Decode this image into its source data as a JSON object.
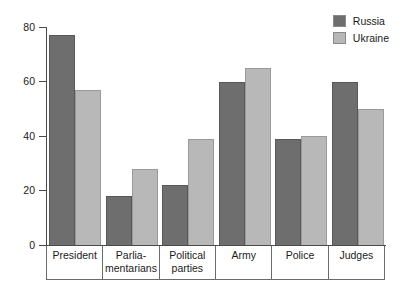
{
  "chart_data": {
    "type": "bar",
    "title": "",
    "subtitle": "",
    "xlabel": "",
    "ylabel": "",
    "ylim": [
      0,
      80
    ],
    "yticks": [
      0,
      20,
      40,
      60,
      80
    ],
    "grid": false,
    "legend_position": "top-right",
    "categories": [
      "President",
      "Parliamentarians",
      "Political parties",
      "Army",
      "Police",
      "Judges"
    ],
    "category_lines": [
      [
        "President"
      ],
      [
        "Parlia-",
        "mentarians"
      ],
      [
        "Political",
        "parties"
      ],
      [
        "Army"
      ],
      [
        "Police"
      ],
      [
        "Judges"
      ]
    ],
    "series": [
      {
        "name": "Russia",
        "color": "#6e6e6e",
        "values": [
          77,
          18,
          22,
          60,
          39,
          60
        ]
      },
      {
        "name": "Ukraine",
        "color": "#b8b8b8",
        "values": [
          57,
          28,
          39,
          65,
          40,
          50
        ]
      }
    ]
  },
  "legend": {
    "entries": [
      {
        "label": "Russia",
        "color": "#6e6e6e"
      },
      {
        "label": "Ukraine",
        "color": "#b8b8b8"
      }
    ]
  },
  "axis": {
    "y_tick_labels": [
      "80",
      "60",
      "40",
      "20",
      "0"
    ]
  }
}
